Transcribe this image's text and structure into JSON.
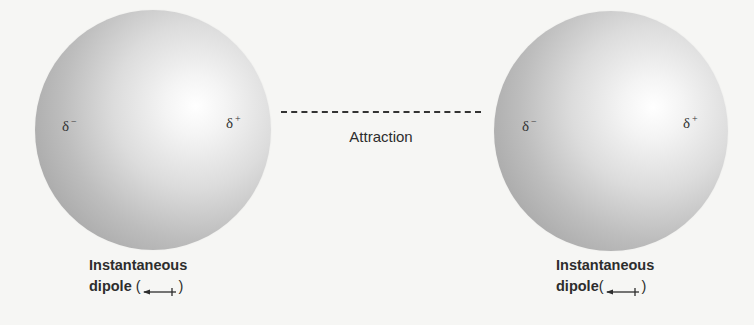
{
  "diagram": {
    "left_atom": {
      "negative_label": "δ",
      "negative_sign": "−",
      "positive_label": "δ",
      "positive_sign": "+",
      "caption_line1": "Instantaneous",
      "caption_line2": "dipole",
      "paren_open": "(",
      "paren_close": ")"
    },
    "right_atom": {
      "negative_label": "δ",
      "negative_sign": "−",
      "positive_label": "δ",
      "positive_sign": "+",
      "caption_line1": "Instantaneous",
      "caption_line2": "dipole",
      "paren_open": "(",
      "paren_close": ")"
    },
    "interaction": {
      "label": "Attraction",
      "line_style": "dashed"
    },
    "colors": {
      "background": "#f6f6f4",
      "sphere_highlight": "#ffffff",
      "sphere_shadow": "#a8a8a8",
      "text": "#2d2d2d"
    }
  }
}
